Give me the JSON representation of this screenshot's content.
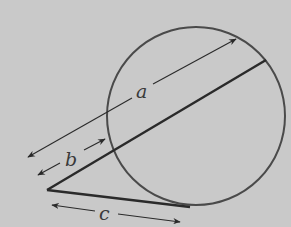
{
  "figure": {
    "type": "secant-tangent-diagram",
    "background_color": "#c9c9c9",
    "stroke_color": "#333333",
    "circle": {
      "cx": 196,
      "cy": 116,
      "r": 89
    },
    "external_point": {
      "x": 47,
      "y": 190
    },
    "secant": {
      "from": [
        47,
        190
      ],
      "to": [
        266,
        60
      ]
    },
    "tangent": {
      "from": [
        47,
        190
      ],
      "to": [
        190,
        207
      ]
    },
    "labels": {
      "a": "a",
      "b": "b",
      "c": "c"
    },
    "dimensions": [
      {
        "name": "a",
        "description": "whole secant segment length",
        "from": [
          28,
          157
        ],
        "to": [
          236,
          39
        ]
      },
      {
        "name": "b",
        "description": "external secant segment length",
        "from": [
          38,
          175
        ],
        "to": [
          105,
          139
        ]
      },
      {
        "name": "c",
        "description": "tangent segment length",
        "from": [
          52,
          205
        ],
        "to": [
          180,
          222
        ]
      }
    ]
  }
}
